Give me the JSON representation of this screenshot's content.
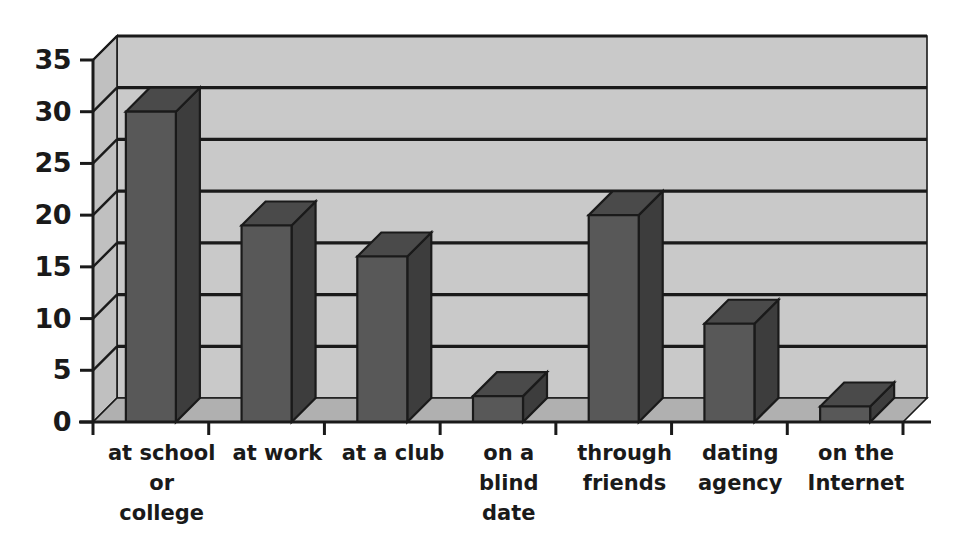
{
  "chart_data": {
    "type": "bar",
    "title": "",
    "subtitle": "",
    "xlabel": "",
    "ylabel": "",
    "categories": [
      "at school\nor\ncollege",
      "at work",
      "at a club",
      "on a\nblind\ndate",
      "through\nfriends",
      "dating\nagency",
      "on the\nInternet"
    ],
    "category_lines": [
      [
        "at school",
        "or",
        "college"
      ],
      [
        "at work"
      ],
      [
        "at a club"
      ],
      [
        "on a",
        "blind",
        "date"
      ],
      [
        "through",
        "friends"
      ],
      [
        "dating",
        "agency"
      ],
      [
        "on the",
        "Internet"
      ]
    ],
    "values": [
      30,
      19,
      16,
      2.5,
      20,
      9.5,
      1.5
    ],
    "ylim": [
      0,
      35
    ],
    "yticks": [
      0,
      5,
      10,
      15,
      20,
      25,
      30,
      35
    ],
    "ytick_labels": [
      "0",
      "5",
      "10",
      "15",
      "20",
      "25",
      "30",
      "35"
    ],
    "grid": true,
    "grid_axis": "y",
    "legend": false,
    "legend_position": "none",
    "style": "3d",
    "series": [
      {
        "name": "",
        "values": [
          30,
          19,
          16,
          2.5,
          20,
          9.5,
          1.5
        ]
      }
    ]
  },
  "colors": {
    "bar_front": "#585858",
    "bar_top": "#4a4a4a",
    "bar_side": "#3d3d3d",
    "bar_edge": "#1a1a1a",
    "back_wall": "#c9c9c9",
    "side_wall": "#c0c0c0",
    "floor": "#b0b0b0",
    "floor_front": "#a8a8a8",
    "gridline": "#1a1a1a",
    "axis": "#1a1a1a",
    "text": "#1a1a1a",
    "background": "#ffffff"
  },
  "geometry": {
    "plot_left": 93,
    "plot_right": 903,
    "baseline_y": 422,
    "top_y": 60,
    "depth_x": 24,
    "depth_y": 24,
    "bar_width": 50,
    "slot_width": 115.7
  }
}
